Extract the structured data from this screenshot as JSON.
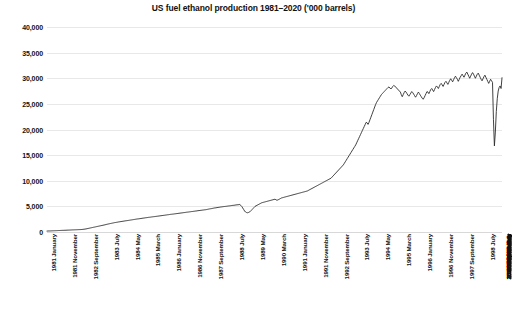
{
  "chart_data": {
    "type": "line",
    "title": "US fuel ethanol production 1981–2020 ('000 barrels)",
    "xlabel": "",
    "ylabel": "",
    "ylim": [
      0,
      40000
    ],
    "grid": true,
    "legend": "none",
    "line_color": "#2b2b2b",
    "gridline_color": "#e8e8e8",
    "y_ticks": [
      0,
      5000,
      10000,
      15000,
      20000,
      25000,
      30000,
      35000,
      40000
    ],
    "y_tick_labels": [
      "0",
      "5,000",
      "10,000",
      "15,000",
      "20,000",
      "25,000",
      "30,000",
      "35,000",
      "40,000"
    ],
    "x_tick_labels": [
      "1981 January",
      "1981 November",
      "1982 September",
      "1983 July",
      "1984 May",
      "1985 March",
      "1986 January",
      "1986 November",
      "1987 September",
      "1988 July",
      "1989 May",
      "1990 March",
      "1991 January",
      "1991 November",
      "1992 September",
      "1993 July",
      "1994 May",
      "1995 March",
      "1996 January",
      "1996 November",
      "1997 September",
      "1998 July",
      "1999 May",
      "2000 March",
      "2001 January",
      "2001 November",
      "2002 September",
      "2003 July",
      "2004 May",
      "2005 March",
      "2006 January",
      "2006 November",
      "2007 September",
      "2008 July",
      "2009 May",
      "2010 March",
      "2011 January",
      "2011 November",
      "2012 September",
      "2013 July",
      "2014 May",
      "2015 March",
      "2016 January",
      "2016 November",
      "2017 September",
      "2018 July",
      "2019 May",
      "2020 March"
    ],
    "x_tick_interval_months": 22,
    "x_start": "1981 January",
    "x_end": "2020 December",
    "series_name": "US fuel ethanol production",
    "values": [
      180,
      190,
      205,
      200,
      215,
      225,
      230,
      240,
      250,
      255,
      262,
      270,
      280,
      285,
      300,
      310,
      318,
      325,
      330,
      340,
      348,
      355,
      362,
      370,
      380,
      388,
      400,
      410,
      418,
      425,
      432,
      440,
      450,
      458,
      465,
      472,
      480,
      500,
      520,
      545,
      570,
      600,
      640,
      680,
      720,
      760,
      800,
      840,
      880,
      920,
      960,
      1000,
      1040,
      1080,
      1120,
      1160,
      1200,
      1240,
      1280,
      1320,
      1360,
      1400,
      1450,
      1500,
      1540,
      1580,
      1620,
      1660,
      1700,
      1740,
      1780,
      1820,
      1850,
      1880,
      1910,
      1950,
      1980,
      2010,
      2040,
      2070,
      2100,
      2130,
      2160,
      2190,
      2210,
      2240,
      2270,
      2300,
      2330,
      2360,
      2390,
      2420,
      2450,
      2480,
      2510,
      2540,
      2560,
      2580,
      2610,
      2640,
      2670,
      2700,
      2720,
      2750,
      2780,
      2800,
      2830,
      2860,
      2880,
      2900,
      2930,
      2960,
      2980,
      3000,
      3030,
      3050,
      3080,
      3100,
      3130,
      3150,
      3180,
      3200,
      3230,
      3250,
      3280,
      3300,
      3330,
      3360,
      3380,
      3410,
      3440,
      3460,
      3480,
      3500,
      3530,
      3550,
      3580,
      3600,
      3630,
      3650,
      3680,
      3700,
      3730,
      3750,
      3780,
      3800,
      3830,
      3860,
      3880,
      3900,
      3930,
      3950,
      3980,
      4000,
      4030,
      4050,
      4080,
      4100,
      4130,
      4160,
      4180,
      4200,
      4230,
      4250,
      4280,
      4300,
      4330,
      4350,
      4380,
      4420,
      4460,
      4500,
      4530,
      4560,
      4600,
      4640,
      4680,
      4700,
      4730,
      4760,
      4790,
      4820,
      4850,
      4880,
      4900,
      4930,
      4960,
      4980,
      5000,
      5020,
      5050,
      5080,
      5100,
      5120,
      5150,
      5180,
      5200,
      5220,
      5250,
      5280,
      5300,
      5320,
      5340,
      5360,
      5200,
      5000,
      4700,
      4400,
      4100,
      3900,
      3800,
      3750,
      3800,
      3900,
      4000,
      4200,
      4400,
      4600,
      4800,
      5000,
      5100,
      5200,
      5300,
      5400,
      5500,
      5600,
      5700,
      5750,
      5800,
      5850,
      5900,
      5950,
      6000,
      6050,
      6100,
      6150,
      6200,
      6250,
      6300,
      6350,
      6400,
      6300,
      6200,
      6250,
      6350,
      6450,
      6550,
      6650,
      6700,
      6750,
      6800,
      6850,
      6900,
      6950,
      7000,
      7050,
      7100,
      7150,
      7200,
      7250,
      7300,
      7350,
      7400,
      7450,
      7500,
      7550,
      7600,
      7650,
      7700,
      7750,
      7800,
      7850,
      7900,
      7950,
      8000,
      8100,
      8200,
      8300,
      8400,
      8500,
      8600,
      8700,
      8800,
      8900,
      9000,
      9100,
      9200,
      9300,
      9400,
      9500,
      9600,
      9700,
      9800,
      9900,
      10000,
      10100,
      10200,
      10300,
      10400,
      10500,
      10700,
      10900,
      11100,
      11300,
      11500,
      11700,
      11900,
      12100,
      12300,
      12500,
      12700,
      12900,
      13100,
      13400,
      13700,
      14000,
      14300,
      14600,
      14900,
      15200,
      15500,
      15800,
      16100,
      16400,
      16700,
      17000,
      17400,
      17800,
      18200,
      18600,
      19000,
      19400,
      19800,
      20200,
      20600,
      21000,
      21400,
      21300,
      21000,
      21400,
      21900,
      22400,
      22900,
      23400,
      23900,
      24400,
      24900,
      25300,
      25600,
      25900,
      26200,
      26500,
      26800,
      27000,
      27200,
      27400,
      27600,
      27800,
      28000,
      28200,
      28300,
      28100,
      27900,
      28100,
      28400,
      28600,
      28500,
      28300,
      28100,
      27900,
      27700,
      27500,
      27300,
      26800,
      26400,
      26800,
      27200,
      27500,
      27300,
      27000,
      26700,
      26500,
      26800,
      27100,
      27400,
      27200,
      26900,
      26600,
      26300,
      26600,
      27000,
      27300,
      27000,
      26700,
      26400,
      26100,
      25900,
      26200,
      26600,
      27000,
      27400,
      27300,
      27000,
      27400,
      27800,
      28000,
      27700,
      27400,
      27800,
      28200,
      28500,
      28300,
      28000,
      28400,
      28800,
      29000,
      28700,
      28400,
      28800,
      29200,
      29400,
      29100,
      28800,
      29200,
      29600,
      29900,
      29600,
      29300,
      29700,
      30100,
      30400,
      30100,
      29800,
      29400,
      29800,
      30200,
      30500,
      30800,
      30500,
      30200,
      30600,
      31000,
      31200,
      30800,
      30400,
      30000,
      30400,
      30800,
      31100,
      30800,
      30400,
      30000,
      30400,
      30800,
      31000,
      30600,
      30200,
      29800,
      29500,
      29900,
      30300,
      30600,
      30200,
      29800,
      29400,
      29000,
      29400,
      29800,
      29500,
      29200,
      22000,
      16800,
      19500,
      23500,
      26000,
      27500,
      28200,
      28500,
      28000,
      30100
    ]
  }
}
